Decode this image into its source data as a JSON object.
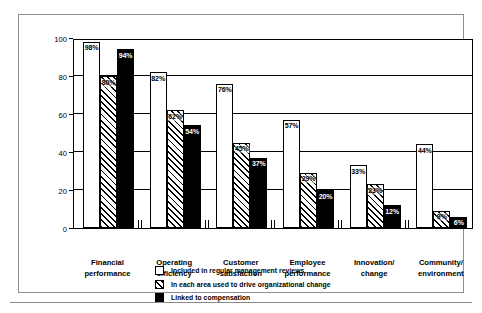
{
  "chart_data": {
    "type": "bar",
    "title": "",
    "xlabel": "",
    "ylabel": "Percent Reporting Measures",
    "ylim": [
      0,
      100
    ],
    "yticks": [
      0,
      20,
      40,
      60,
      80,
      100
    ],
    "ytick_labels": [
      "0",
      "20",
      "40",
      "60",
      "80",
      "100"
    ],
    "grid": true,
    "legend_position": "bottom",
    "categories": [
      "Financial performance",
      "Operating efficiency",
      "Customer satisfaction",
      "Employee performance",
      "Innovation/ change",
      "Community/ environment"
    ],
    "category_lines": [
      [
        "Financial",
        "performance"
      ],
      [
        "Operating",
        "efficiency"
      ],
      [
        "Customer",
        "satisfaction"
      ],
      [
        "Employee",
        "performance"
      ],
      [
        "Innovation/",
        "change"
      ],
      [
        "Community/",
        "environment"
      ]
    ],
    "series": [
      {
        "name": "Included in regular management reviews",
        "fill": "white",
        "values": [
          98,
          82,
          76,
          57,
          33,
          44
        ],
        "labels": [
          "98%",
          "82%",
          "76%",
          "57%",
          "33%",
          "44%"
        ]
      },
      {
        "name": "In each area used to drive organizational change",
        "fill": "hatched",
        "values": [
          80,
          62,
          45,
          29,
          23,
          9
        ],
        "labels": [
          "80%",
          "62%",
          "45%",
          "29%",
          "23%",
          "9%"
        ]
      },
      {
        "name": "Linked to compensation",
        "fill": "black",
        "values": [
          94,
          54,
          37,
          20,
          12,
          6
        ],
        "labels": [
          "94%",
          "54%",
          "37%",
          "20%",
          "12%",
          "6%"
        ]
      }
    ]
  },
  "legend": {
    "items": [
      {
        "label": "Included in regular management reviews",
        "swatch": "white-square-icon"
      },
      {
        "label": "In each area used to drive organizational change",
        "swatch": "hatched-square-icon"
      },
      {
        "label": "Linked to compensation",
        "swatch": "black-square-icon"
      }
    ]
  },
  "colors": {
    "frame": "#8e8e8e",
    "axis": "#000000",
    "bar_white": "#ffffff",
    "bar_black": "#000000",
    "background": "#ffffff"
  }
}
